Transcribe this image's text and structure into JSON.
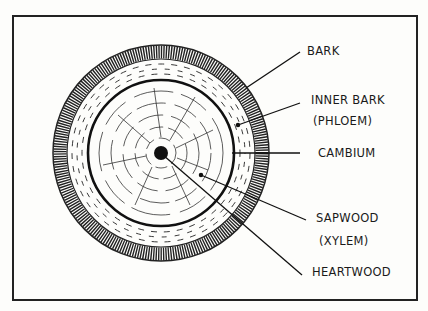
{
  "diagram": {
    "labels": [
      {
        "id": "bark",
        "text": "BARK"
      },
      {
        "id": "inner-bark",
        "text": "INNER BARK"
      },
      {
        "id": "phloem",
        "text": "(PHLOEM)"
      },
      {
        "id": "cambium",
        "text": "CAMBIUM"
      },
      {
        "id": "sapwood",
        "text": "SAPWOOD"
      },
      {
        "id": "xylem",
        "text": "(XYLEM)"
      },
      {
        "id": "heartwood",
        "text": "HEARTWOOD"
      }
    ],
    "colors": {
      "ink": "#1a1a1a",
      "paper": "#fdfdfb"
    }
  }
}
